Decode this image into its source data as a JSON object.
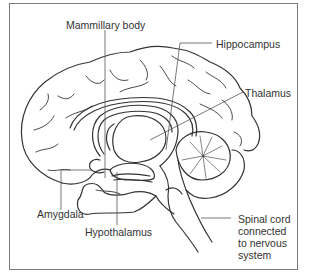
{
  "diagram": {
    "labels": {
      "mammillary_body": "Mammillary body",
      "hippocampus": "Hippocampus",
      "thalamus": "Thalamus",
      "amygdala": "Amygdala",
      "hypothalamus": "Hypothalamus",
      "spinal_cord_line1": "Spinal cord",
      "spinal_cord_line2": "connected",
      "spinal_cord_line3": "to nervous",
      "spinal_cord_line4": "system"
    },
    "colors": {
      "line": "#333333",
      "frame": "#7a7a7a",
      "background": "#ffffff"
    }
  }
}
